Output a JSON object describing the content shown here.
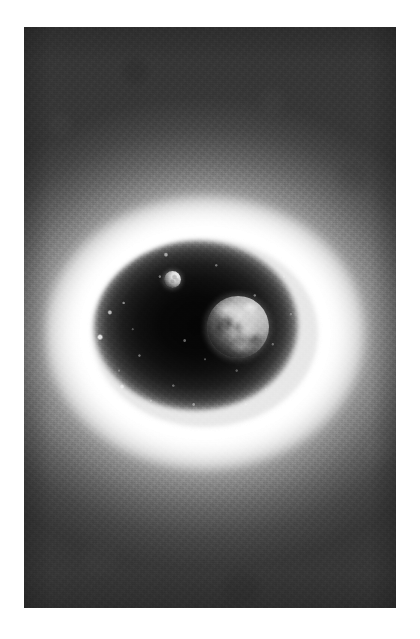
{
  "page": {
    "background_color": "#ffffff",
    "width": 420,
    "height": 639
  },
  "plate": {
    "label": "astronomical illustration plate",
    "x": 24,
    "y": 27,
    "width": 372,
    "height": 581,
    "palette": {
      "space_background": "#3a3a3a",
      "halo_bright": "#ffffff",
      "cavity_dark": "#070707",
      "earth_highlight": "#d8d8d8",
      "moon_highlight": "#f2f2f2",
      "page_white": "#ffffff"
    }
  },
  "scene": {
    "type": "grayscale space artwork",
    "subject": "Earth and Moon enclosed by a luminous elliptical shell",
    "elements": {
      "shell": {
        "name": "luminous elliptical shell",
        "center_x": 205,
        "center_y": 333,
        "radius_x": 122,
        "radius_y": 103
      },
      "halo": {
        "name": "outer glow halo",
        "radius_x": 280,
        "radius_y": 235
      },
      "cavity": {
        "name": "dark interior cavity",
        "radius_x": 113,
        "radius_y": 94
      },
      "earth": {
        "name": "Earth",
        "center_x": 238,
        "center_y": 327,
        "diameter": 62,
        "lit_from": "upper right"
      },
      "moon": {
        "name": "Moon",
        "center_x": 172,
        "center_y": 279,
        "diameter": 17,
        "lit_from": "upper right",
        "phase": "crescent"
      }
    }
  }
}
